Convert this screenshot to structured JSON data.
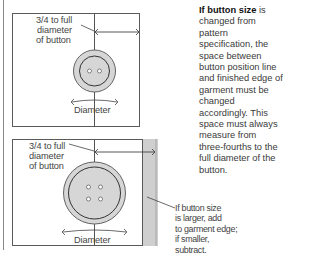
{
  "diagram": {
    "top": {
      "label_spacing": [
        "3/4 to full",
        "diameter",
        "of button"
      ],
      "label_diameter": "Diameter",
      "button_holes": 2
    },
    "bottom": {
      "label_spacing": [
        "3/4 to full",
        "diameter",
        "of button"
      ],
      "label_diameter": "Diameter",
      "button_holes": 4,
      "edge_note": [
        "If button size",
        "is larger, add",
        "to garment edge;",
        "if smaller,",
        "subtract."
      ]
    },
    "colors": {
      "line": "#5a5a5a",
      "button_fill": "#d8d8d8",
      "garment_edge": "#cfcfcf"
    }
  },
  "explanation": {
    "bold_lead": "If button size",
    "text": " is changed from pattern specification, the space between button position line and finished edge of garment must be changed accordingly. This space must always measure from three-fourths to the full diameter of the button."
  }
}
